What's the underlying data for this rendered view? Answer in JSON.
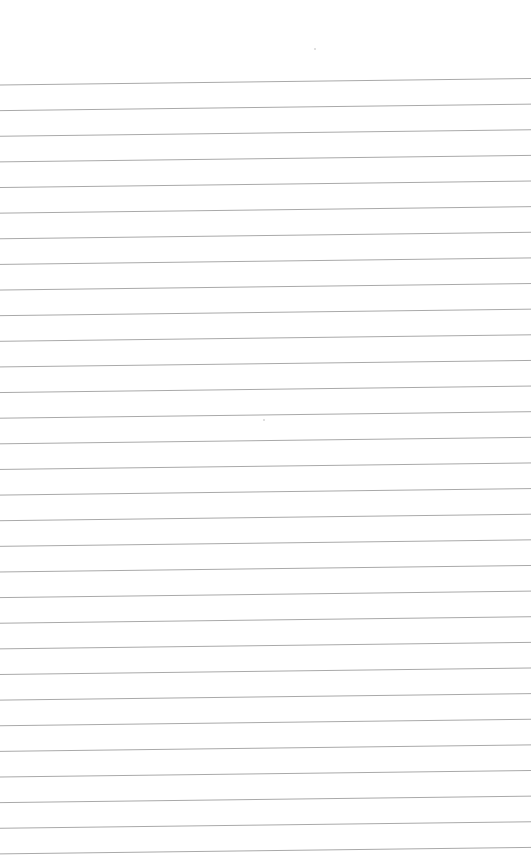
{
  "page": {
    "type": "blank lined paper",
    "width": 531,
    "height": 864,
    "background_color": "#ffffff"
  },
  "ruling": {
    "line_color": "#a9a9a9",
    "line_thickness": 1,
    "line_count": 31,
    "first_line_left_y": 85,
    "first_line_right_y": 78.5,
    "spacing": 25.63
  },
  "specks": [
    {
      "x": 314,
      "y": 48
    },
    {
      "x": 263,
      "y": 419
    }
  ]
}
